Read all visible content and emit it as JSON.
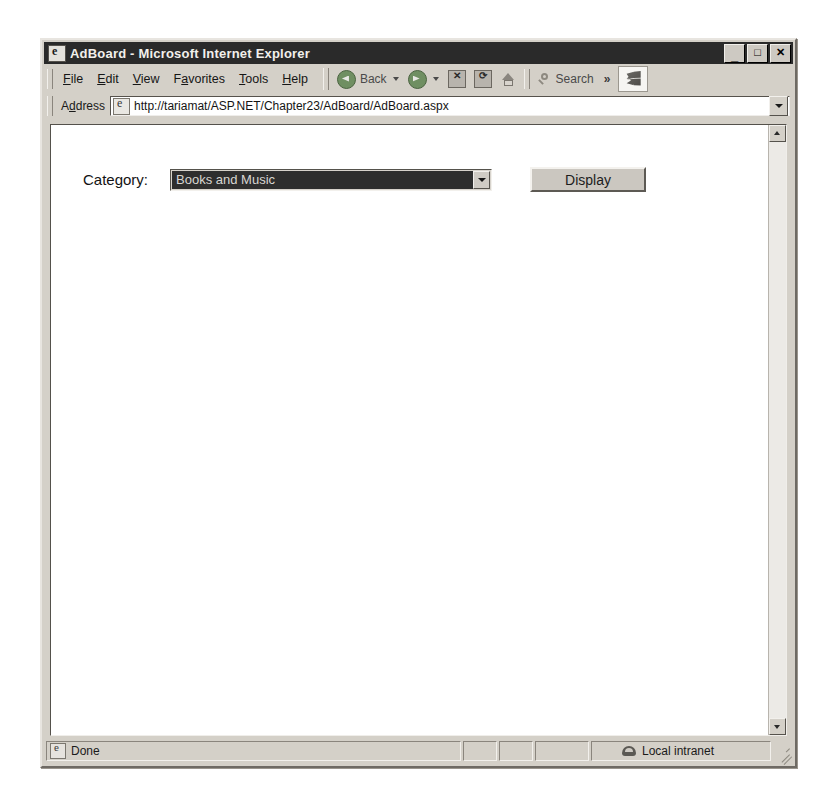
{
  "window": {
    "title": "AdBoard - Microsoft Internet Explorer",
    "title_icon": "ie-page-icon",
    "controls": {
      "minimize": "_",
      "maximize": "□",
      "close": "✕"
    }
  },
  "menu": {
    "items": [
      {
        "label": "File",
        "accel": "F"
      },
      {
        "label": "Edit",
        "accel": "E"
      },
      {
        "label": "View",
        "accel": "V"
      },
      {
        "label": "Favorites",
        "accel": "a"
      },
      {
        "label": "Tools",
        "accel": "T"
      },
      {
        "label": "Help",
        "accel": "H"
      }
    ]
  },
  "toolbar": {
    "back_label": "Back",
    "search_label": "Search",
    "overflow_label": "»",
    "icons": {
      "back": "back-arrow-icon",
      "forward": "forward-arrow-icon",
      "stop": "stop-icon",
      "refresh": "refresh-icon",
      "home": "home-icon",
      "search": "search-icon",
      "brand": "windows-logo-icon"
    },
    "stop_glyph": "✕",
    "refresh_glyph": "⟳"
  },
  "address": {
    "label": "Address",
    "url": "http://tariamat/ASP.NET/Chapter23/AdBoard/AdBoard.aspx",
    "placeholder": "Address"
  },
  "page": {
    "category_label": "Category:",
    "category_selected": "Books and Music",
    "display_label": "Display"
  },
  "statusbar": {
    "text": "Done",
    "zone": "Local intranet"
  }
}
